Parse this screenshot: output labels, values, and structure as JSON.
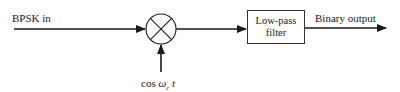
{
  "diagram": {
    "type": "block-diagram",
    "input": {
      "label": "BPSK in"
    },
    "mixer": {
      "symbol": "multiplier-circle-x"
    },
    "carrier": {
      "prefix": "cos ",
      "symbol": "ω",
      "subscript": "c",
      "suffix": " t"
    },
    "filter": {
      "line1": "Low-pass",
      "line2": "filter"
    },
    "output": {
      "label": "Binary output"
    },
    "colors": {
      "stroke": "#1a1a1a",
      "background": "#ffffff"
    }
  }
}
